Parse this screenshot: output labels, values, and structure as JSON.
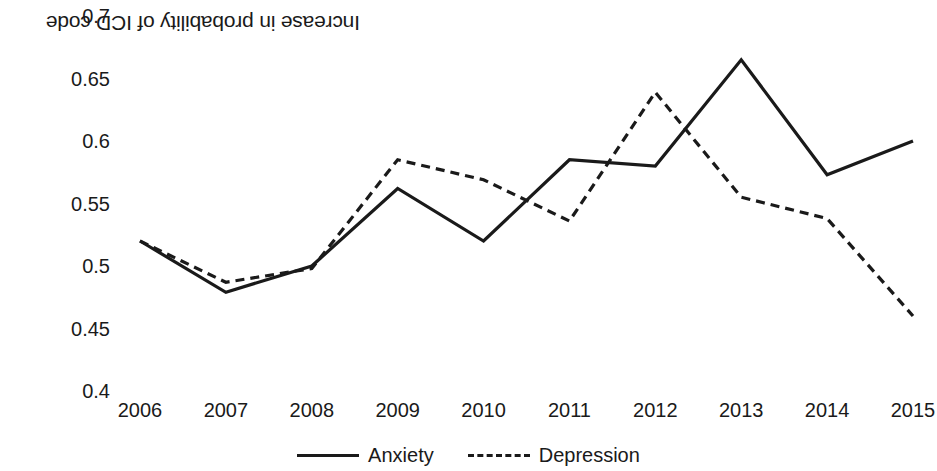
{
  "chart_data": {
    "type": "line",
    "title": "",
    "subtitle": "",
    "xlabel": "",
    "ylabel": "Increase in probability of ICD code",
    "x": [
      2006,
      2007,
      2008,
      2009,
      2010,
      2011,
      2012,
      2013,
      2014,
      2015
    ],
    "categories": [
      "2006",
      "2007",
      "2008",
      "2009",
      "2010",
      "2011",
      "2012",
      "2013",
      "2014",
      "2015"
    ],
    "series": [
      {
        "name": "Anxiety",
        "style": "solid",
        "color": "#1a1a1a",
        "values": [
          0.52,
          0.479,
          0.5,
          0.562,
          0.52,
          0.585,
          0.58,
          0.665,
          0.573,
          0.6
        ]
      },
      {
        "name": "Depression",
        "style": "dashed",
        "color": "#1a1a1a",
        "values": [
          0.52,
          0.487,
          0.498,
          0.585,
          0.569,
          0.536,
          0.639,
          0.555,
          0.538,
          0.46
        ]
      }
    ],
    "ylim": [
      0.4,
      0.7
    ],
    "ytick_step": 0.05,
    "yticks": [
      0.7,
      0.65,
      0.6,
      0.55,
      0.5,
      0.45,
      0.4
    ],
    "ytick_labels": [
      "0.7",
      "0.65",
      "0.6",
      "0.55",
      "0.5",
      "0.45",
      "0.4"
    ],
    "xlim": [
      2006,
      2015
    ],
    "grid": false,
    "legend_position": "bottom-center",
    "legend": [
      "Anxiety",
      "Depression"
    ]
  },
  "axes": {
    "y_title": "Increase in probability of ICD code",
    "y_tick_labels": [
      "0.7",
      "0.65",
      "0.6",
      "0.55",
      "0.5",
      "0.45",
      "0.4"
    ],
    "x_tick_labels": [
      "2006",
      "2007",
      "2008",
      "2009",
      "2010",
      "2011",
      "2012",
      "2013",
      "2014",
      "2015"
    ]
  },
  "legend": {
    "items": [
      {
        "label": "Anxiety",
        "style": "solid"
      },
      {
        "label": "Depression",
        "style": "dashed"
      }
    ]
  },
  "colors": {
    "line": "#1a1a1a",
    "text": "#1a1a1a",
    "background": "#ffffff"
  }
}
